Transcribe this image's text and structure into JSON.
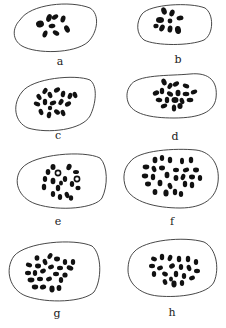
{
  "figure": {
    "panels": [
      {
        "label": "a",
        "chromosome_count_approx": 8
      },
      {
        "label": "b",
        "chromosome_count_approx": 9
      },
      {
        "label": "c",
        "chromosome_count_approx": 18
      },
      {
        "label": "d",
        "chromosome_count_approx": 20
      },
      {
        "label": "e",
        "chromosome_count_approx": 18
      },
      {
        "label": "f",
        "chromosome_count_approx": 30
      },
      {
        "label": "g",
        "chromosome_count_approx": 30
      },
      {
        "label": "h",
        "chromosome_count_approx": 30
      }
    ],
    "colors": {
      "outline": "#333333",
      "chromosome": "#111111",
      "background": "#ffffff"
    }
  }
}
